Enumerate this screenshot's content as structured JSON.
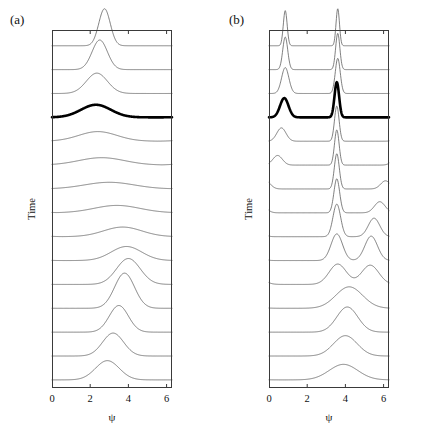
{
  "figure": {
    "width": 434,
    "height": 434,
    "background": "#ffffff"
  },
  "panels": [
    {
      "id": "a",
      "label": "(a)",
      "xlabel": "ψ",
      "ylabel": "Time",
      "xticks": [
        0,
        2,
        4,
        6
      ],
      "xtick_labels": [
        "0",
        "2",
        "4",
        "6"
      ],
      "xlim": [
        0,
        6.2832
      ],
      "box": {
        "left": 52,
        "top": 30,
        "width": 120,
        "height": 358
      },
      "trace_color": "#555555",
      "highlight_color": "#000000",
      "highlight_index": 11
    },
    {
      "id": "b",
      "label": "(b)",
      "xlabel": "ψ",
      "ylabel": "Time",
      "xticks": [
        0,
        2,
        4,
        6
      ],
      "xtick_labels": [
        "0",
        "2",
        "4",
        "6"
      ],
      "xlim": [
        0,
        6.2832
      ],
      "box": {
        "left": 269,
        "top": 30,
        "width": 120,
        "height": 358
      },
      "trace_color": "#555555",
      "highlight_color": "#000000",
      "highlight_index": 11
    }
  ],
  "chart_data": [
    {
      "type": "line",
      "id": "panel-a",
      "title": "(a)",
      "xlabel": "ψ",
      "ylabel": "Time",
      "xlim": [
        0,
        6.2832
      ],
      "xticks": [
        0,
        2,
        4,
        6
      ],
      "grid": false,
      "legend": "none",
      "description": "Waterfall of 15 stacked probability-density traces P(psi) versus psi, advancing in time from the bottom trace (earliest) to the top trace (latest). A broad single hump near psi = 3 narrows and sharpens into a tall peak that drifts toward psi = 3.1. The 12th trace from the bottom is drawn bold.",
      "n_traces": 15,
      "highlight_index": 11,
      "trace_order": "bottom = earliest time, top = latest time",
      "series": [
        {
          "name": "t1",
          "peaks": [
            {
              "center": 2.9,
              "amplitude": 0.52,
              "width": 0.62
            }
          ]
        },
        {
          "name": "t2",
          "peaks": [
            {
              "center": 3.2,
              "amplitude": 0.62,
              "width": 0.55
            }
          ]
        },
        {
          "name": "t3",
          "peaks": [
            {
              "center": 3.5,
              "amplitude": 0.72,
              "width": 0.5
            }
          ]
        },
        {
          "name": "t4",
          "peaks": [
            {
              "center": 3.8,
              "amplitude": 0.95,
              "width": 0.52
            }
          ]
        },
        {
          "name": "t5",
          "peaks": [
            {
              "center": 4.0,
              "amplitude": 0.7,
              "width": 0.62
            }
          ]
        },
        {
          "name": "t6",
          "peaks": [
            {
              "center": 3.9,
              "amplitude": 0.38,
              "width": 0.8
            }
          ]
        },
        {
          "name": "t7",
          "peaks": [
            {
              "center": 3.7,
              "amplitude": 0.26,
              "width": 1.0
            }
          ]
        },
        {
          "name": "t8",
          "peaks": [
            {
              "center": 3.4,
              "amplitude": 0.2,
              "width": 1.2
            }
          ]
        },
        {
          "name": "t9",
          "peaks": [
            {
              "center": 3.0,
              "amplitude": 0.18,
              "width": 1.3
            }
          ]
        },
        {
          "name": "t10",
          "peaks": [
            {
              "center": 2.6,
              "amplitude": 0.2,
              "width": 1.2
            }
          ]
        },
        {
          "name": "t11",
          "peaks": [
            {
              "center": 2.4,
              "amplitude": 0.26,
              "width": 1.0
            }
          ]
        },
        {
          "name": "t12",
          "peaks": [
            {
              "center": 2.3,
              "amplitude": 0.34,
              "width": 0.78
            }
          ]
        },
        {
          "name": "t13",
          "peaks": [
            {
              "center": 2.35,
              "amplitude": 0.55,
              "width": 0.55
            }
          ]
        },
        {
          "name": "t14",
          "peaks": [
            {
              "center": 2.5,
              "amplitude": 0.8,
              "width": 0.4
            }
          ]
        },
        {
          "name": "t15",
          "peaks": [
            {
              "center": 2.75,
              "amplitude": 1.0,
              "width": 0.3
            }
          ]
        }
      ]
    },
    {
      "type": "line",
      "id": "panel-b",
      "title": "(b)",
      "xlabel": "ψ",
      "ylabel": "Time",
      "xlim": [
        0,
        6.2832
      ],
      "xticks": [
        0,
        2,
        4,
        6
      ],
      "grid": false,
      "legend": "none",
      "description": "Waterfall of 15 stacked probability-density traces P(psi) versus psi, advancing in time from the bottom trace (earliest) to the top trace (latest). A single broad hump near psi = 4 splits into two sharp peaks that separate; one peak migrates left toward psi = 0.8 (wrapping) while the other stays near psi = 3.6. The 12th trace from the bottom is drawn bold.",
      "n_traces": 15,
      "highlight_index": 11,
      "trace_order": "bottom = earliest time, top = latest time",
      "series": [
        {
          "name": "t1",
          "peaks": [
            {
              "center": 3.9,
              "amplitude": 0.42,
              "width": 0.75
            }
          ]
        },
        {
          "name": "t2",
          "peaks": [
            {
              "center": 4.0,
              "amplitude": 0.55,
              "width": 0.62
            }
          ]
        },
        {
          "name": "t3",
          "peaks": [
            {
              "center": 4.1,
              "amplitude": 0.68,
              "width": 0.55
            }
          ]
        },
        {
          "name": "t4",
          "peaks": [
            {
              "center": 4.2,
              "amplitude": 0.58,
              "width": 0.7
            }
          ]
        },
        {
          "name": "t5",
          "peaks": [
            {
              "center": 3.6,
              "amplitude": 0.55,
              "width": 0.45
            },
            {
              "center": 5.3,
              "amplitude": 0.52,
              "width": 0.45
            }
          ]
        },
        {
          "name": "t6",
          "peaks": [
            {
              "center": 3.55,
              "amplitude": 0.72,
              "width": 0.3
            },
            {
              "center": 5.35,
              "amplitude": 0.66,
              "width": 0.33
            }
          ]
        },
        {
          "name": "t7",
          "peaks": [
            {
              "center": 3.55,
              "amplitude": 0.88,
              "width": 0.2
            },
            {
              "center": 5.5,
              "amplitude": 0.5,
              "width": 0.3
            }
          ]
        },
        {
          "name": "t8",
          "peaks": [
            {
              "center": 3.55,
              "amplitude": 0.92,
              "width": 0.15
            },
            {
              "center": 5.8,
              "amplitude": 0.3,
              "width": 0.28
            }
          ]
        },
        {
          "name": "t9",
          "peaks": [
            {
              "center": 3.55,
              "amplitude": 0.95,
              "width": 0.13
            },
            {
              "center": 6.1,
              "amplitude": 0.22,
              "width": 0.25
            }
          ]
        },
        {
          "name": "t10",
          "peaks": [
            {
              "center": 3.55,
              "amplitude": 0.95,
              "width": 0.12
            },
            {
              "center": 0.45,
              "amplitude": 0.26,
              "width": 0.25
            }
          ]
        },
        {
          "name": "t11",
          "peaks": [
            {
              "center": 3.55,
              "amplitude": 0.95,
              "width": 0.12
            },
            {
              "center": 0.65,
              "amplitude": 0.36,
              "width": 0.24
            }
          ]
        },
        {
          "name": "t12",
          "peaks": [
            {
              "center": 3.55,
              "amplitude": 0.95,
              "width": 0.12
            },
            {
              "center": 0.8,
              "amplitude": 0.52,
              "width": 0.22
            }
          ]
        },
        {
          "name": "t13",
          "peaks": [
            {
              "center": 3.6,
              "amplitude": 0.95,
              "width": 0.13
            },
            {
              "center": 0.85,
              "amplitude": 0.7,
              "width": 0.19
            }
          ]
        },
        {
          "name": "t14",
          "peaks": [
            {
              "center": 3.6,
              "amplitude": 0.98,
              "width": 0.11
            },
            {
              "center": 0.85,
              "amplitude": 0.88,
              "width": 0.13
            }
          ]
        },
        {
          "name": "t15",
          "peaks": [
            {
              "center": 3.6,
              "amplitude": 1.0,
              "width": 0.09
            },
            {
              "center": 0.85,
              "amplitude": 0.95,
              "width": 0.1
            }
          ]
        }
      ]
    }
  ]
}
